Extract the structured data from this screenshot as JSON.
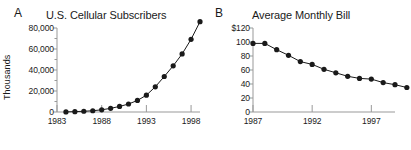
{
  "figure": {
    "panels": [
      {
        "letter": "A",
        "title": "U.S. Cellular Subscribers",
        "ylabel": "Thousands"
      },
      {
        "letter": "B",
        "title": "Average Monthly Bill",
        "ylabel": ""
      }
    ]
  },
  "chart_data": [
    {
      "type": "line",
      "panel": "A",
      "title": "U.S. Cellular Subscribers",
      "xlabel": "",
      "ylabel": "Thousands",
      "xlim": [
        1983,
        1999
      ],
      "ylim": [
        0,
        80000
      ],
      "xticks": [
        1983,
        1988,
        1993,
        1998
      ],
      "xtick_labels": [
        "1983",
        "1988",
        "1993",
        "1998"
      ],
      "yticks": [
        0,
        20000,
        40000,
        60000,
        80000
      ],
      "ytick_labels": [
        "0",
        "20,000",
        "40,000",
        "60,000",
        "80,000"
      ],
      "minor_yticks": [
        10000,
        30000,
        50000,
        70000
      ],
      "grid": false,
      "legend": false,
      "marker": "filled-circle",
      "line_color": "#1a1a1a",
      "marker_color": "#1a1a1a",
      "axis_color": "#999999",
      "x": [
        1984,
        1985,
        1986,
        1987,
        1988,
        1989,
        1990,
        1991,
        1992,
        1993,
        1994,
        1995,
        1996,
        1997,
        1998,
        1999
      ],
      "values": [
        92,
        340,
        682,
        1231,
        2069,
        3509,
        5283,
        7557,
        11033,
        16009,
        24134,
        33786,
        44043,
        55312,
        69209,
        86047
      ],
      "plotted_values": [
        100,
        350,
        700,
        1200,
        2100,
        3500,
        5300,
        7600,
        11000,
        16000,
        24000,
        33800,
        44000,
        55300,
        69200,
        86000
      ]
    },
    {
      "type": "line",
      "panel": "B",
      "title": "Average Monthly Bill",
      "xlabel": "",
      "ylabel": "",
      "xlim": [
        1987,
        1999
      ],
      "ylim": [
        0,
        120
      ],
      "xticks": [
        1987,
        1992,
        1997
      ],
      "xtick_labels": [
        "1987",
        "1992",
        "1997"
      ],
      "yticks": [
        0,
        20,
        40,
        60,
        80,
        100,
        120
      ],
      "ytick_labels": [
        "0",
        "20",
        "40",
        "60",
        "80",
        "100",
        "$120"
      ],
      "grid": false,
      "legend": false,
      "marker": "filled-circle",
      "line_color": "#1a1a1a",
      "marker_color": "#1a1a1a",
      "axis_color": "#999999",
      "x": [
        1987,
        1988,
        1989,
        1990,
        1991,
        1992,
        1993,
        1994,
        1995,
        1996,
        1997,
        1998,
        1999,
        2000
      ],
      "values": [
        98,
        98,
        89,
        81,
        72,
        68,
        61,
        56,
        51,
        48,
        47,
        42,
        39,
        35
      ]
    }
  ]
}
